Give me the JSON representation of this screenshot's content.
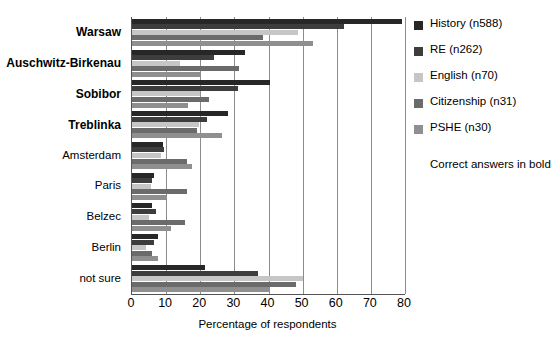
{
  "chart_data": {
    "type": "bar",
    "orientation": "horizontal",
    "title": "",
    "xlabel": "Percentage of respondents",
    "ylabel": "",
    "xlim": [
      0,
      80
    ],
    "xticks": [
      0,
      10,
      20,
      30,
      40,
      50,
      60,
      70,
      80
    ],
    "grid": true,
    "legend_position": "right",
    "categories": [
      "Warsaw",
      "Auschwitz-Birkenau",
      "Sobibor",
      "Treblinka",
      "Amsterdam",
      "Paris",
      "Belzec",
      "Berlin",
      "not sure"
    ],
    "bold_categories": [
      "Warsaw",
      "Auschwitz-Birkenau",
      "Sobibor",
      "Treblinka"
    ],
    "series": [
      {
        "name": "History (n588)",
        "color": "#272727",
        "values": [
          79.0,
          33.0,
          40.5,
          28.0,
          9.0,
          6.5,
          6.0,
          7.5,
          21.5
        ]
      },
      {
        "name": "RE (n262)",
        "color": "#3d3d3d",
        "values": [
          62.0,
          24.0,
          31.0,
          22.0,
          9.5,
          6.0,
          7.0,
          6.5,
          37.0
        ]
      },
      {
        "name": "English (n70)",
        "color": "#c6c6c6",
        "values": [
          48.5,
          14.0,
          20.0,
          19.5,
          8.5,
          5.5,
          5.0,
          4.0,
          50.0
        ]
      },
      {
        "name": "Citizenship (n31)",
        "color": "#6b6b6b",
        "values": [
          38.5,
          31.5,
          22.5,
          19.0,
          16.0,
          16.0,
          15.5,
          6.0,
          48.0
        ]
      },
      {
        "name": "PSHE (n30)",
        "color": "#8f8f8f",
        "values": [
          53.0,
          20.0,
          16.5,
          26.5,
          17.5,
          10.0,
          11.5,
          7.5,
          40.0
        ]
      }
    ],
    "annotation": "Correct answers in bold"
  },
  "legend": {
    "items": [
      {
        "label": "History (n588)"
      },
      {
        "label": "RE (n262)"
      },
      {
        "label": "English (n70)"
      },
      {
        "label": "Citizenship (n31)"
      },
      {
        "label": "PSHE (n30)"
      }
    ],
    "note": "Correct answers in bold"
  },
  "axis": {
    "ticks": [
      "0",
      "10",
      "20",
      "30",
      "40",
      "50",
      "60",
      "70",
      "80"
    ],
    "xlabel": "Percentage of respondents"
  }
}
